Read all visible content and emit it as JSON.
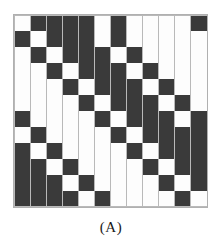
{
  "figure": {
    "caption": "(A)",
    "title": "",
    "colors": {
      "on_cell": "#3a3a3a",
      "off_cell": "#fdfdfd",
      "gridline": "#b9b9b9",
      "background": "#ffffff"
    }
  },
  "chart_data": {
    "type": "heatmap",
    "title": "(A)",
    "xlabel": "",
    "ylabel": "",
    "rows": 12,
    "cols": 12,
    "value_labels": {
      "1": "filled",
      "0": "empty"
    },
    "grid": "on",
    "legend": "none",
    "base_row": [
      0,
      1,
      1,
      1,
      1,
      0,
      1,
      0,
      0,
      0,
      0,
      1
    ],
    "matrix": [
      [
        0,
        1,
        1,
        1,
        1,
        0,
        1,
        0,
        0,
        0,
        0,
        1
      ],
      [
        1,
        0,
        1,
        1,
        1,
        0,
        1,
        0,
        0,
        0,
        0,
        0
      ],
      [
        0,
        1,
        0,
        1,
        1,
        1,
        0,
        1,
        0,
        0,
        0,
        0
      ],
      [
        0,
        0,
        1,
        0,
        1,
        1,
        1,
        0,
        1,
        0,
        0,
        0
      ],
      [
        0,
        0,
        0,
        1,
        0,
        1,
        1,
        1,
        0,
        1,
        0,
        0
      ],
      [
        0,
        0,
        0,
        0,
        1,
        0,
        1,
        1,
        1,
        0,
        1,
        0
      ],
      [
        1,
        0,
        0,
        0,
        0,
        1,
        0,
        1,
        1,
        1,
        0,
        1
      ],
      [
        0,
        1,
        0,
        0,
        0,
        0,
        1,
        0,
        1,
        1,
        1,
        1
      ],
      [
        1,
        0,
        1,
        0,
        0,
        0,
        0,
        1,
        0,
        1,
        1,
        1
      ],
      [
        1,
        1,
        0,
        1,
        0,
        0,
        0,
        0,
        1,
        0,
        1,
        1
      ],
      [
        1,
        1,
        1,
        0,
        1,
        0,
        0,
        0,
        0,
        1,
        0,
        1
      ],
      [
        1,
        1,
        1,
        1,
        0,
        1,
        0,
        0,
        0,
        0,
        1,
        0
      ]
    ]
  }
}
